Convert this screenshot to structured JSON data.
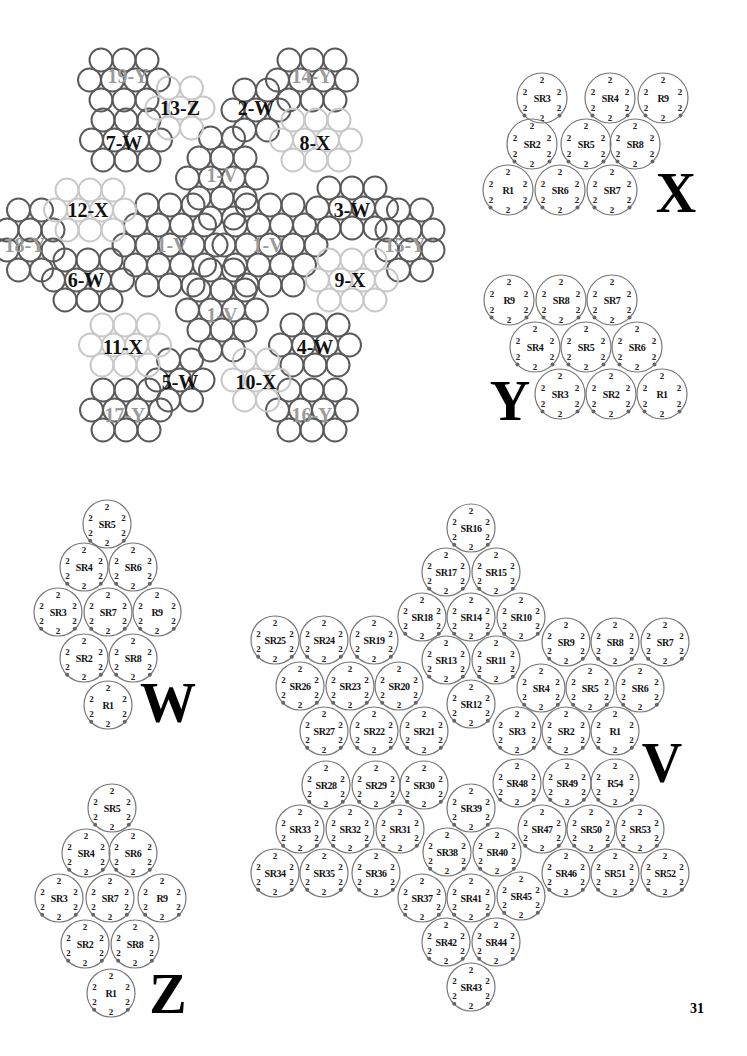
{
  "page_number": "31",
  "overview": {
    "title": "assembly-map",
    "labels": [
      {
        "text": "19-Y",
        "x": 128,
        "y": 76,
        "faded": true
      },
      {
        "text": "14-Y",
        "x": 312,
        "y": 76,
        "faded": true
      },
      {
        "text": "13-Z",
        "x": 180,
        "y": 108
      },
      {
        "text": "2-W",
        "x": 256,
        "y": 108
      },
      {
        "text": "7-W",
        "x": 124,
        "y": 143
      },
      {
        "text": "8-X",
        "x": 315,
        "y": 143
      },
      {
        "text": "1-V",
        "x": 222,
        "y": 175,
        "faded": true
      },
      {
        "text": "12-X",
        "x": 88,
        "y": 210
      },
      {
        "text": "3-W",
        "x": 352,
        "y": 210
      },
      {
        "text": "18-Y",
        "x": 25,
        "y": 245,
        "faded": true
      },
      {
        "text": "1-V",
        "x": 172,
        "y": 245,
        "faded": true
      },
      {
        "text": "1-V",
        "x": 268,
        "y": 245,
        "faded": true
      },
      {
        "text": "15-Y",
        "x": 405,
        "y": 245,
        "faded": true
      },
      {
        "text": "6-W",
        "x": 86,
        "y": 280
      },
      {
        "text": "9-X",
        "x": 350,
        "y": 280
      },
      {
        "text": "1-V",
        "x": 222,
        "y": 315,
        "faded": true
      },
      {
        "text": "11-X",
        "x": 123,
        "y": 347
      },
      {
        "text": "4-W",
        "x": 315,
        "y": 347
      },
      {
        "text": "5-W",
        "x": 180,
        "y": 382
      },
      {
        "text": "10-X",
        "x": 256,
        "y": 382
      },
      {
        "text": "17-Y",
        "x": 125,
        "y": 415,
        "faded": true
      },
      {
        "text": "16-Y",
        "x": 312,
        "y": 415,
        "faded": true
      }
    ]
  },
  "motifs": {
    "X": {
      "letter": "X",
      "letter_pos": [
        676,
        212
      ],
      "rings": [
        {
          "name": "SR3",
          "x": 542,
          "y": 98
        },
        {
          "name": "SR4",
          "x": 610,
          "y": 98
        },
        {
          "name": "R9",
          "x": 663,
          "y": 98
        },
        {
          "name": "SR2",
          "x": 532,
          "y": 144
        },
        {
          "name": "SR5",
          "x": 586,
          "y": 144
        },
        {
          "name": "SR8",
          "x": 635,
          "y": 144
        },
        {
          "name": "R1",
          "x": 508,
          "y": 190
        },
        {
          "name": "SR6",
          "x": 560,
          "y": 190
        },
        {
          "name": "SR7",
          "x": 612,
          "y": 190
        }
      ]
    },
    "Y": {
      "letter": "Y",
      "letter_pos": [
        510,
        420
      ],
      "rings": [
        {
          "name": "R9",
          "x": 509,
          "y": 300
        },
        {
          "name": "SR8",
          "x": 561,
          "y": 300
        },
        {
          "name": "SR7",
          "x": 612,
          "y": 300
        },
        {
          "name": "SR4",
          "x": 535,
          "y": 347
        },
        {
          "name": "SR5",
          "x": 586,
          "y": 347
        },
        {
          "name": "SR6",
          "x": 637,
          "y": 347
        },
        {
          "name": "SR3",
          "x": 560,
          "y": 394
        },
        {
          "name": "SR2",
          "x": 611,
          "y": 394
        },
        {
          "name": "R1",
          "x": 662,
          "y": 394
        }
      ]
    },
    "W": {
      "letter": "W",
      "letter_pos": [
        168,
        722
      ],
      "rings": [
        {
          "name": "SR5",
          "x": 107,
          "y": 524
        },
        {
          "name": "SR4",
          "x": 84,
          "y": 567
        },
        {
          "name": "SR6",
          "x": 133,
          "y": 567
        },
        {
          "name": "SR3",
          "x": 58,
          "y": 612
        },
        {
          "name": "SR7",
          "x": 108,
          "y": 612
        },
        {
          "name": "R9",
          "x": 157,
          "y": 612
        },
        {
          "name": "SR2",
          "x": 84,
          "y": 658
        },
        {
          "name": "SR8",
          "x": 133,
          "y": 658
        },
        {
          "name": "R1",
          "x": 108,
          "y": 705
        }
      ]
    },
    "Z": {
      "letter": "Z",
      "letter_pos": [
        168,
        1013
      ],
      "rings": [
        {
          "name": "SR5",
          "x": 112,
          "y": 808
        },
        {
          "name": "SR4",
          "x": 86,
          "y": 853
        },
        {
          "name": "SR6",
          "x": 133,
          "y": 853
        },
        {
          "name": "SR3",
          "x": 59,
          "y": 898
        },
        {
          "name": "SR7",
          "x": 110,
          "y": 898
        },
        {
          "name": "R9",
          "x": 162,
          "y": 898
        },
        {
          "name": "SR2",
          "x": 85,
          "y": 944
        },
        {
          "name": "SR8",
          "x": 135,
          "y": 944
        },
        {
          "name": "R1",
          "x": 111,
          "y": 993
        }
      ]
    },
    "V": {
      "letter": "V",
      "letter_pos": [
        662,
        782
      ],
      "rings": [
        {
          "name": "SR16",
          "x": 471,
          "y": 528
        },
        {
          "name": "SR17",
          "x": 446,
          "y": 572
        },
        {
          "name": "SR15",
          "x": 496,
          "y": 572
        },
        {
          "name": "SR18",
          "x": 422,
          "y": 617
        },
        {
          "name": "SR14",
          "x": 471,
          "y": 617
        },
        {
          "name": "SR10",
          "x": 521,
          "y": 617
        },
        {
          "name": "SR25",
          "x": 275,
          "y": 640
        },
        {
          "name": "SR24",
          "x": 324,
          "y": 640
        },
        {
          "name": "SR19",
          "x": 374,
          "y": 640
        },
        {
          "name": "SR13",
          "x": 446,
          "y": 660
        },
        {
          "name": "SR11",
          "x": 496,
          "y": 660
        },
        {
          "name": "SR9",
          "x": 566,
          "y": 642
        },
        {
          "name": "SR8",
          "x": 615,
          "y": 642
        },
        {
          "name": "SR7",
          "x": 665,
          "y": 642
        },
        {
          "name": "SR26",
          "x": 300,
          "y": 686
        },
        {
          "name": "SR23",
          "x": 350,
          "y": 686
        },
        {
          "name": "SR20",
          "x": 399,
          "y": 686
        },
        {
          "name": "SR4",
          "x": 541,
          "y": 688
        },
        {
          "name": "SR5",
          "x": 590,
          "y": 688
        },
        {
          "name": "SR6",
          "x": 640,
          "y": 688
        },
        {
          "name": "SR12",
          "x": 471,
          "y": 704
        },
        {
          "name": "SR27",
          "x": 324,
          "y": 731
        },
        {
          "name": "SR22",
          "x": 374,
          "y": 731
        },
        {
          "name": "SR21",
          "x": 424,
          "y": 731
        },
        {
          "name": "SR3",
          "x": 517,
          "y": 731
        },
        {
          "name": "SR2",
          "x": 566,
          "y": 731
        },
        {
          "name": "R1",
          "x": 615,
          "y": 731
        },
        {
          "name": "SR28",
          "x": 326,
          "y": 785
        },
        {
          "name": "SR29",
          "x": 376,
          "y": 785
        },
        {
          "name": "SR30",
          "x": 424,
          "y": 785
        },
        {
          "name": "SR48",
          "x": 517,
          "y": 783
        },
        {
          "name": "SR49",
          "x": 567,
          "y": 783
        },
        {
          "name": "R54",
          "x": 615,
          "y": 783
        },
        {
          "name": "SR39",
          "x": 471,
          "y": 808
        },
        {
          "name": "SR33",
          "x": 300,
          "y": 829
        },
        {
          "name": "SR32",
          "x": 350,
          "y": 829
        },
        {
          "name": "SR31",
          "x": 400,
          "y": 829
        },
        {
          "name": "SR47",
          "x": 542,
          "y": 829
        },
        {
          "name": "SR50",
          "x": 591,
          "y": 829
        },
        {
          "name": "SR53",
          "x": 640,
          "y": 829
        },
        {
          "name": "SR38",
          "x": 447,
          "y": 852
        },
        {
          "name": "SR40",
          "x": 497,
          "y": 852
        },
        {
          "name": "SR34",
          "x": 275,
          "y": 873
        },
        {
          "name": "SR35",
          "x": 324,
          "y": 873
        },
        {
          "name": "SR36",
          "x": 376,
          "y": 873
        },
        {
          "name": "SR46",
          "x": 566,
          "y": 873
        },
        {
          "name": "SR51",
          "x": 615,
          "y": 873
        },
        {
          "name": "SR52",
          "x": 665,
          "y": 873
        },
        {
          "name": "SR37",
          "x": 422,
          "y": 898
        },
        {
          "name": "SR41",
          "x": 471,
          "y": 898
        },
        {
          "name": "SR45",
          "x": 521,
          "y": 896
        },
        {
          "name": "SR42",
          "x": 446,
          "y": 942
        },
        {
          "name": "SR44",
          "x": 496,
          "y": 942
        },
        {
          "name": "SR43",
          "x": 471,
          "y": 987
        }
      ]
    }
  },
  "colors": {
    "ring": "#777777",
    "dark_bead": "#5a5a5a",
    "light_bead": "#c8c8c8",
    "dot": "#666666",
    "text": "#111111"
  }
}
